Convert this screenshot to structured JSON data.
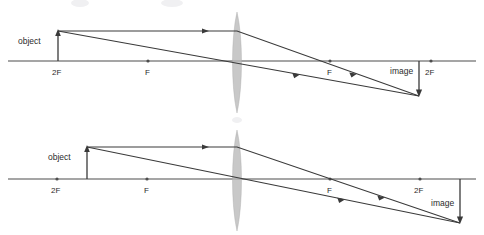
{
  "figure": {
    "title": "",
    "background_color": "#ffffff",
    "line_color": "#3a3a3a",
    "axis_color": "#4d4d4d",
    "lens_color": "#b8b8b8",
    "width": 484,
    "height": 235
  },
  "diagrams": [
    {
      "id": "top-diagram",
      "name": "object-beyond-2F",
      "axis_y": 61,
      "lens_x": 237,
      "lens_top": 12,
      "lens_bottom": 113,
      "object": {
        "label": "object",
        "label_x": 18,
        "label_y": 44,
        "x": 58,
        "tip_y": 31,
        "base_y": 61
      },
      "image": {
        "label": "image",
        "label_x": 390,
        "label_y": 74,
        "x": 419,
        "base_y": 61,
        "tip_y": 96
      },
      "markers": [
        {
          "label": "2F",
          "x": 58,
          "label_y": 74,
          "side": "left",
          "dot": false
        },
        {
          "label": "F",
          "x": 148,
          "label_y": 74,
          "side": "left",
          "dot": true
        },
        {
          "label": "F",
          "x": 330,
          "label_y": 74,
          "side": "right",
          "dot": true
        },
        {
          "label": "2F",
          "x": 431,
          "label_y": 74,
          "side": "right",
          "dot": true
        }
      ],
      "rays": [
        {
          "name": "parallel-ray",
          "points": "58,31 237,31 419,96",
          "arrow_at": [
            {
              "x": 205,
              "y": 31,
              "angle": 0
            },
            {
              "x": 352,
              "y": 72,
              "angle": 19.7
            }
          ]
        },
        {
          "name": "center-ray",
          "points": "58,31 419,96",
          "arrow_at": [
            {
              "x": 295,
              "y": 74,
              "angle": 10.2
            }
          ]
        }
      ]
    },
    {
      "id": "bottom-diagram",
      "name": "object-between-2F-and-F",
      "axis_y": 179,
      "lens_x": 237,
      "lens_top": 130,
      "lens_bottom": 231,
      "object": {
        "label": "object",
        "label_x": 48,
        "label_y": 160,
        "x": 87,
        "tip_y": 147,
        "base_y": 179
      },
      "image": {
        "label": "image",
        "label_x": 431,
        "label_y": 205,
        "x": 460,
        "base_y": 179,
        "tip_y": 223
      },
      "markers": [
        {
          "label": "2F",
          "x": 57,
          "label_y": 192,
          "side": "left",
          "dot": true
        },
        {
          "label": "F",
          "x": 147,
          "label_y": 192,
          "side": "left",
          "dot": true
        },
        {
          "label": "F",
          "x": 330,
          "label_y": 192,
          "side": "right",
          "dot": true
        },
        {
          "label": "2F",
          "x": 420,
          "label_y": 192,
          "side": "right",
          "dot": true
        }
      ],
      "rays": [
        {
          "name": "parallel-ray",
          "points": "87,147 237,147 460,223",
          "arrow_at": [
            {
              "x": 205,
              "y": 147,
              "angle": 0
            },
            {
              "x": 380,
              "y": 195,
              "angle": 18.8
            }
          ]
        },
        {
          "name": "center-ray",
          "points": "87,147 460,223",
          "arrow_at": [
            {
              "x": 340,
              "y": 198,
              "angle": 11.5
            }
          ]
        }
      ]
    }
  ],
  "legend": {
    "object_label": "object",
    "image_label": "image",
    "focal_label": "F",
    "double_focal_label": "2F"
  }
}
